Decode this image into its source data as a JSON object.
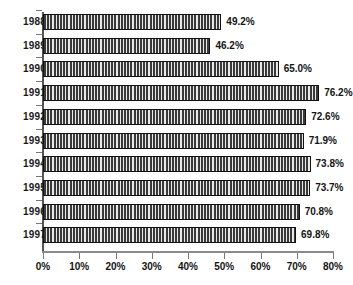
{
  "chart_data": {
    "type": "bar",
    "orientation": "horizontal",
    "title": "",
    "xlabel": "",
    "ylabel": "",
    "categories": [
      "1988",
      "1989",
      "1990",
      "1991",
      "1992",
      "1993",
      "1994",
      "1995",
      "1996",
      "1997"
    ],
    "values": [
      49.2,
      46.2,
      65.0,
      76.2,
      72.6,
      71.9,
      73.8,
      73.7,
      70.8,
      69.8
    ],
    "data_labels": [
      "49.2%",
      "46.2%",
      "65.0%",
      "76.2%",
      "72.6%",
      "71.9%",
      "73.8%",
      "73.7%",
      "70.8%",
      "69.8%"
    ],
    "xlim": [
      0,
      80
    ],
    "x_tick_values": [
      0,
      10,
      20,
      30,
      40,
      50,
      60,
      70,
      80
    ],
    "x_tick_labels": [
      "0%",
      "10%",
      "20%",
      "30%",
      "40%",
      "50%",
      "60%",
      "70%",
      "80%"
    ],
    "grid": false,
    "legend": false,
    "legend_position": "none",
    "colors": {
      "bar_fill_dark": "#3a3a3a",
      "bar_fill_light": "#e8e8e8",
      "bar_border": "#111111",
      "axis": "#777777",
      "text": "#141414",
      "background": "#ffffff"
    }
  }
}
